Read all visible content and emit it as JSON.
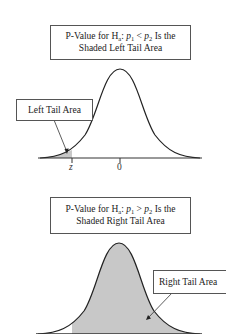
{
  "diagrams": [
    {
      "id": "left-tail",
      "title_line1_prefix": "P-Value for H",
      "title_sub_a": "a",
      "title_colon": ": ",
      "title_p1": "p",
      "title_p1_sub": "1",
      "title_operator": " < ",
      "title_p2": "p",
      "title_p2_sub": "2",
      "title_line1_suffix": " Is the",
      "title_line2": "Shaded Left Tail Area",
      "callout": "Left Tail Area",
      "x_ticks": [
        "z",
        "0"
      ],
      "shade_color": "#c8c8c8"
    },
    {
      "id": "right-tail",
      "title_line1_prefix": "P-Value for H",
      "title_sub_a": "a",
      "title_colon": ": ",
      "title_p1": "p",
      "title_p1_sub": "1",
      "title_operator": " > ",
      "title_p2": "p",
      "title_p2_sub": "2",
      "title_line1_suffix": " Is the",
      "title_line2": "Shaded Right Tail Area",
      "callout": "Right Tail Area",
      "shade_color": "#c8c8c8"
    }
  ]
}
